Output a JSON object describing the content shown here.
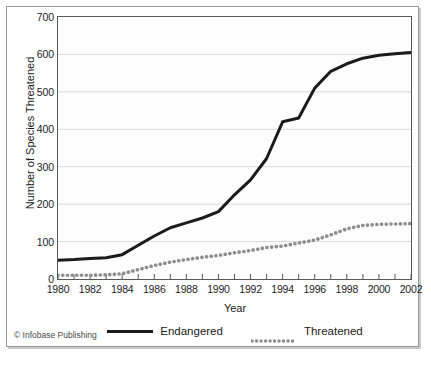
{
  "credit": "© Infobase Publishing",
  "chart_data": {
    "type": "line",
    "title": "",
    "xlabel": "Year",
    "ylabel": "Number of Species Threatened",
    "xlim": [
      1980,
      2002
    ],
    "ylim": [
      0,
      700
    ],
    "ytick_values": [
      0,
      100,
      200,
      300,
      400,
      500,
      600,
      700
    ],
    "ytick_labels": [
      "0",
      "100",
      "200",
      "300",
      "400",
      "500",
      "600",
      "700"
    ],
    "xtick_values": [
      1980,
      1982,
      1984,
      1986,
      1988,
      1990,
      1992,
      1994,
      1996,
      1998,
      2000,
      2002
    ],
    "xtick_labels": [
      "1980",
      "1982",
      "1984",
      "1986",
      "1988",
      "1990",
      "1992",
      "1994",
      "1996",
      "1998",
      "2000",
      "2002"
    ],
    "minor_xticks": [
      1981,
      1983,
      1985,
      1987,
      1989,
      1991,
      1993,
      1995,
      1997,
      1999,
      2001
    ],
    "grid": "horizontal",
    "legend_position": "below",
    "x": [
      1980,
      1981,
      1982,
      1983,
      1984,
      1985,
      1986,
      1987,
      1988,
      1989,
      1990,
      1991,
      1992,
      1993,
      1994,
      1995,
      1996,
      1997,
      1998,
      1999,
      2000,
      2001,
      2002
    ],
    "series": [
      {
        "name": "Endangered",
        "color": "#1b1b1b",
        "style": "solid",
        "values": [
          50,
          52,
          55,
          57,
          65,
          90,
          115,
          137,
          150,
          163,
          180,
          225,
          265,
          322,
          420,
          430,
          510,
          555,
          575,
          590,
          598,
          602,
          605
        ]
      },
      {
        "name": "Threatened",
        "color": "#8d8d8d",
        "style": "dotted",
        "values": [
          10,
          10,
          10,
          11,
          14,
          25,
          36,
          45,
          52,
          58,
          63,
          70,
          76,
          84,
          88,
          96,
          104,
          118,
          134,
          143,
          146,
          147,
          148
        ]
      }
    ]
  }
}
